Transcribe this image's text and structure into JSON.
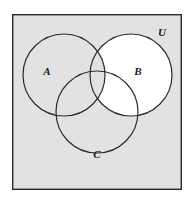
{
  "figure": {
    "name": "venn-diagram-three-sets",
    "type": "venn-diagram",
    "width": 193,
    "height": 200,
    "page_background": "#ffffff"
  },
  "universe": {
    "label": "U",
    "label_x": 162,
    "label_y": 33,
    "frame": {
      "x": 12,
      "y": 14,
      "width": 170,
      "height": 176,
      "fill": "#e2e2e2",
      "stroke": "#2b2b2b",
      "stroke_width": 1.4
    }
  },
  "sets": [
    {
      "label": "A",
      "cx": 64,
      "cy": 75,
      "r": 41,
      "label_x": 47,
      "label_y": 72,
      "fill": "#e2e2e2",
      "stroke": "#2b2b2b"
    },
    {
      "label": "B",
      "cx": 131,
      "cy": 75,
      "r": 41,
      "label_x": 138,
      "label_y": 72,
      "fill": "#ffffff",
      "stroke": "#2b2b2b"
    },
    {
      "label": "C",
      "cx": 97,
      "cy": 112,
      "r": 41,
      "label_x": 97,
      "label_y": 155,
      "fill": "#e2e2e2",
      "stroke": "#2b2b2b"
    }
  ],
  "shading": {
    "description": "B minus A",
    "shaded_fill": "#ffffff",
    "unshaded_fill": "#e2e2e2",
    "stroke_width": 1.2
  },
  "chart_data": {
    "type": "venn",
    "title": "",
    "sets": [
      "A",
      "B",
      "C"
    ],
    "universe_label": "U",
    "regions": [
      {
        "id": "outside-all",
        "expression": "U - (A union B union C)",
        "shaded": false
      },
      {
        "id": "A-only",
        "expression": "A - (B union C)",
        "shaded": false
      },
      {
        "id": "B-only",
        "expression": "B - (A union C)",
        "shaded": true
      },
      {
        "id": "C-only",
        "expression": "C - (A union B)",
        "shaded": false
      },
      {
        "id": "A-and-B",
        "expression": "(A intersect B) - C",
        "shaded": false
      },
      {
        "id": "B-and-C",
        "expression": "(B intersect C) - A",
        "shaded": true
      },
      {
        "id": "A-and-C",
        "expression": "(A intersect C) - B",
        "shaded": false
      },
      {
        "id": "A-and-B-and-C",
        "expression": "A intersect B intersect C",
        "shaded": false
      }
    ],
    "shaded_expression": "B - A",
    "legend": null,
    "grid": false
  }
}
